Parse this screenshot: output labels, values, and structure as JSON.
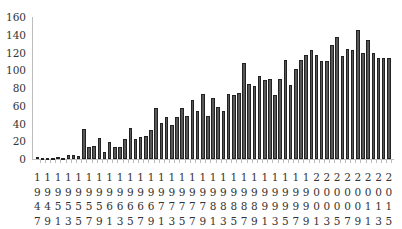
{
  "chart_data": {
    "type": "bar",
    "title": "",
    "xlabel": "",
    "ylabel": "",
    "ylim": [
      0,
      160
    ],
    "yticks": [
      0,
      20,
      40,
      60,
      80,
      100,
      120,
      140,
      160
    ],
    "grid": false,
    "legend": null,
    "tick_labels": [
      "1947",
      "1949",
      "1951",
      "1953",
      "1955",
      "1957",
      "1959",
      "1961",
      "1963",
      "1965",
      "1967",
      "1969",
      "1971",
      "1973",
      "1975",
      "1977",
      "1979",
      "1981",
      "1983",
      "1985",
      "1987",
      "1989",
      "1991",
      "1993",
      "1995",
      "1997",
      "1999",
      "2001",
      "2003",
      "2005",
      "2007",
      "2009",
      "2011",
      "2013",
      "2015"
    ],
    "categories": [
      "1947",
      "1948",
      "1949",
      "1950",
      "1951",
      "1952",
      "1953",
      "1954",
      "1955",
      "1956",
      "1957",
      "1958",
      "1959",
      "1960",
      "1961",
      "1962",
      "1963",
      "1964",
      "1965",
      "1966",
      "1967",
      "1968",
      "1969",
      "1970",
      "1971",
      "1972",
      "1973",
      "1974",
      "1975",
      "1976",
      "1977",
      "1978",
      "1979",
      "1980",
      "1981",
      "1982",
      "1983",
      "1984",
      "1985",
      "1986",
      "1987",
      "1988",
      "1989",
      "1990",
      "1991",
      "1992",
      "1993",
      "1994",
      "1995",
      "1996",
      "1997",
      "1998",
      "1999",
      "2000",
      "2001",
      "2002",
      "2003",
      "2004",
      "2005",
      "2006",
      "2007",
      "2008",
      "2009",
      "2010",
      "2011",
      "2012",
      "2013",
      "2014",
      "2015"
    ],
    "values": [
      2,
      1,
      1,
      1,
      2,
      1,
      4,
      4,
      3,
      34,
      13,
      15,
      24,
      8,
      19,
      14,
      14,
      23,
      35,
      22,
      25,
      26,
      33,
      58,
      41,
      47,
      38,
      47,
      58,
      48,
      67,
      54,
      73,
      49,
      69,
      59,
      54,
      73,
      72,
      74,
      108,
      85,
      82,
      94,
      89,
      90,
      72,
      90,
      111,
      83,
      101,
      112,
      117,
      123,
      117,
      110,
      110,
      129,
      138,
      116,
      124,
      123,
      145,
      119,
      134,
      120,
      114,
      114,
      114
    ]
  }
}
